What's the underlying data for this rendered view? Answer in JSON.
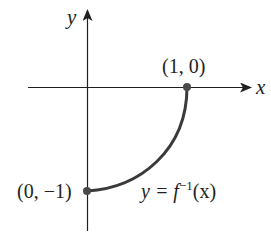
{
  "diagram": {
    "axes": {
      "x_label": "x",
      "y_label": "y"
    },
    "points": [
      {
        "label": "(1, 0)",
        "x": 1,
        "y": 0
      },
      {
        "label": "(0, −1)",
        "x": 0,
        "y": -1
      }
    ],
    "curve": {
      "label_prefix": "y = f",
      "label_sup": "−1",
      "label_suffix": "(x)",
      "description": "Quarter-circle arc from (0,-1) to (1,0), concave, graph of inverse function"
    },
    "colors": {
      "ink": "#231f20",
      "curve": "#3a3a3a",
      "point": "#4a4a4a"
    }
  }
}
